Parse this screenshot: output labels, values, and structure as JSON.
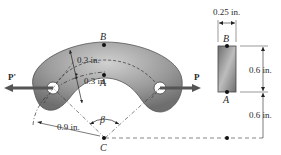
{
  "diagram": {
    "type": "curved-bar-mechanics",
    "points": {
      "B": "B",
      "A": "A",
      "C": "C"
    },
    "forces": {
      "left": "P'",
      "right": "P"
    },
    "angle_label": "β",
    "dimensions": {
      "outer_thickness": "0.3 in.",
      "inner_thickness": "0.3 in.",
      "inner_radius": "0.9 in.",
      "section_width": "0.25 in.",
      "section_height": "0.6 in.",
      "offset_to_center": "0.6 in."
    },
    "colors": {
      "bar_fill": "#8a8a8a",
      "bar_light": "#c8c8c8",
      "arrow": "#555555",
      "line": "#333333"
    }
  }
}
